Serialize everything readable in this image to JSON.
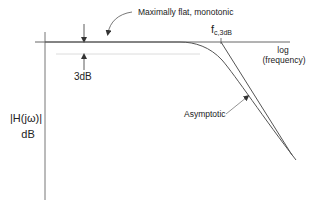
{
  "diagram": {
    "annotations": {
      "maximally_flat": "Maximally flat, monotonic",
      "three_db": "3dB",
      "fc_main": "f",
      "fc_sub": "c,3dB",
      "x_axis_line1": "log",
      "x_axis_line2": "(frequency)",
      "y_axis_line1": "|H(jω)|",
      "y_axis_line2": "dB",
      "asymptotic": "Asymptotic"
    },
    "colors": {
      "axis": "#707070",
      "curve": "#555555",
      "dashed": "#d8d8d8",
      "text": "#222222"
    }
  }
}
